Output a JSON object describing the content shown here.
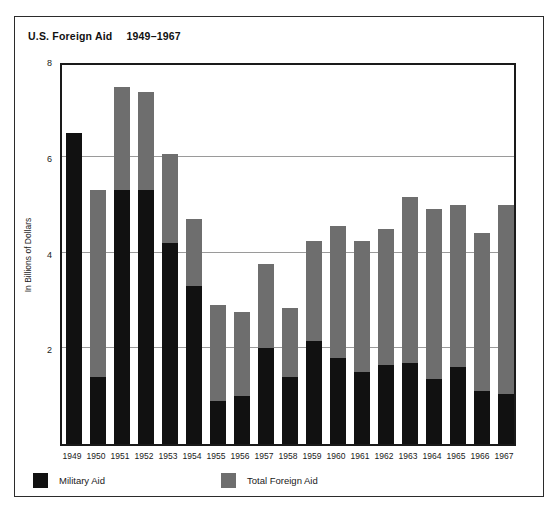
{
  "chart_data": {
    "type": "bar",
    "subtype": "overlapping-stacked",
    "title": "U.S. Foreign Aid",
    "title_range": "1949–1967",
    "xlabel": "",
    "ylabel": "In Billions of Dollars",
    "ylim": [
      0,
      8
    ],
    "yticks": [
      8,
      6,
      4,
      2
    ],
    "ytick_labels": [
      "8",
      "6",
      "4",
      "2"
    ],
    "grid": true,
    "grid_axis": "y",
    "legend_position": "bottom-left",
    "categories": [
      "1949",
      "1950",
      "1951",
      "1952",
      "1953",
      "1954",
      "1955",
      "1956",
      "1957",
      "1958",
      "1959",
      "1960",
      "1961",
      "1962",
      "1963",
      "1964",
      "1965",
      "1966",
      "1967"
    ],
    "series": [
      {
        "name": "Total Foreign Aid",
        "color": "#6e6e6e",
        "values": [
          6.5,
          5.3,
          7.45,
          7.35,
          6.05,
          4.7,
          2.9,
          2.75,
          3.75,
          2.85,
          4.25,
          4.55,
          4.25,
          4.5,
          5.15,
          4.9,
          5.0,
          4.4,
          5.0
        ]
      },
      {
        "name": "Military Aid",
        "color": "#111111",
        "values": [
          6.5,
          1.4,
          5.3,
          5.3,
          4.2,
          3.3,
          0.9,
          1.0,
          2.0,
          1.4,
          2.15,
          1.8,
          1.5,
          1.65,
          1.7,
          1.35,
          1.6,
          1.1,
          1.05
        ]
      }
    ]
  },
  "legend": {
    "items": [
      {
        "label": "Military Aid",
        "swatch": "black-square-icon"
      },
      {
        "label": "Total Foreign Aid",
        "swatch": "gray-square-icon"
      }
    ]
  }
}
